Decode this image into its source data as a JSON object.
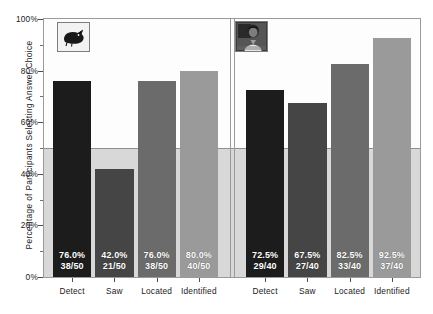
{
  "chart_data": {
    "type": "bar",
    "title": "",
    "xlabel": "",
    "ylabel": "Percentage of Participants Selecting Answer Choice",
    "ylim": [
      0,
      100
    ],
    "ytick_labels": [
      "0%",
      "20%",
      "40%",
      "60%",
      "80%",
      "100%"
    ],
    "ytick_values": [
      0,
      20,
      40,
      60,
      80,
      100
    ],
    "yminor_values": [
      10,
      30,
      50,
      70,
      90
    ],
    "reference_line": 50,
    "grid": false,
    "legend": "none",
    "panels": [
      {
        "name": "panel-left",
        "thumbnail": "dark-animal-silhouette-thumbnail",
        "categories": [
          "Detect",
          "Saw",
          "Located",
          "Identified"
        ],
        "values": [
          76.0,
          42.0,
          76.0,
          80.0
        ],
        "labels_pct": [
          "76.0%",
          "42.0%",
          "76.0%",
          "80.0%"
        ],
        "labels_frac": [
          "38/50",
          "21/50",
          "38/50",
          "40/50"
        ],
        "colors": [
          "#1c1c1c",
          "#454545",
          "#6b6b6b",
          "#9a9a9a"
        ]
      },
      {
        "name": "panel-right",
        "thumbnail": "person-photo-thumbnail",
        "categories": [
          "Detect",
          "Saw",
          "Located",
          "Identified"
        ],
        "values": [
          72.5,
          67.5,
          82.5,
          92.5
        ],
        "labels_pct": [
          "72.5%",
          "67.5%",
          "82.5%",
          "92.5%"
        ],
        "labels_frac": [
          "29/40",
          "27/40",
          "33/40",
          "37/40"
        ],
        "colors": [
          "#1c1c1c",
          "#454545",
          "#6b6b6b",
          "#9a9a9a"
        ]
      }
    ]
  },
  "colors": {
    "background": "#ffffff",
    "plot_background": "#fdfdfd",
    "lower_band": "#d8d8d8",
    "frame": "#9a9a9a",
    "reference_line": "#8e8e8e",
    "text": "#1a1a1a",
    "bar_label_text": "#ffffff"
  }
}
